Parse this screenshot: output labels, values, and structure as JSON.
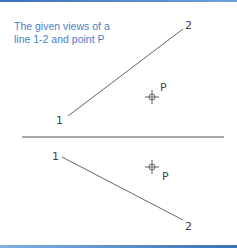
{
  "caption": {
    "line1": "The given views of a",
    "line2": "line 1-2 and point P"
  },
  "top_view": {
    "line": {
      "p1": [
        68,
        116
      ],
      "p2": [
        183,
        29
      ]
    },
    "labels": {
      "point1": "1",
      "point2": "2",
      "pointP": "P"
    },
    "point_P": [
      152,
      97
    ]
  },
  "folding_line": {
    "x1": 22,
    "y1": 137,
    "x2": 224,
    "y2": 137
  },
  "bottom_view": {
    "line": {
      "p1": [
        62,
        157
      ],
      "p2": [
        183,
        220
      ]
    },
    "labels": {
      "point1": "1",
      "point2": "2",
      "pointP": "P"
    },
    "point_P": [
      152,
      167
    ]
  },
  "colors": {
    "caption": "#4a7fc8",
    "lines": "#555555",
    "border": "#3a72b8"
  }
}
